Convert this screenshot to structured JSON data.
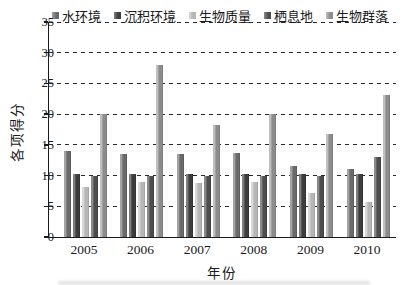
{
  "figure": {
    "background_color": "#ffffff",
    "axis_color": "#1a1a1a"
  },
  "chart_data": {
    "type": "bar",
    "title": "",
    "xlabel": "年份",
    "ylabel": "各项得分",
    "categories": [
      "2005",
      "2006",
      "2007",
      "2008",
      "2009",
      "2010"
    ],
    "series": [
      {
        "name": "水环境",
        "color": "#6a6a6a",
        "color_light": "#a2a2a2",
        "color_dark": "#565656",
        "values": [
          14.0,
          13.5,
          13.5,
          13.7,
          11.5,
          11.0
        ]
      },
      {
        "name": "沉积环境",
        "color": "#3d3d3d",
        "color_light": "#7e7e7e",
        "color_dark": "#2e2e2e",
        "values": [
          10.2,
          10.2,
          10.2,
          10.2,
          10.2,
          10.2
        ]
      },
      {
        "name": "生物质量",
        "color": "#b6b6b6",
        "color_light": "#d8d8d8",
        "color_dark": "#9c9c9c",
        "values": [
          8.1,
          8.9,
          8.8,
          8.9,
          7.2,
          5.7
        ]
      },
      {
        "name": "栖息地",
        "color": "#4d4d4d",
        "color_light": "#8a8a8a",
        "color_dark": "#3c3c3c",
        "values": [
          10.0,
          10.0,
          10.0,
          10.0,
          10.0,
          13.0
        ]
      },
      {
        "name": "生物群落",
        "color": "#8c8c8c",
        "color_light": "#bfbfbf",
        "color_dark": "#757575",
        "values": [
          20.0,
          28.0,
          18.2,
          20.0,
          16.7,
          23.2
        ]
      }
    ],
    "ylim": [
      0,
      35
    ],
    "yticks": [
      0,
      5,
      10,
      15,
      20,
      25,
      30,
      35
    ],
    "grid": "horizontal-dashed",
    "legend_position": "top-inside-horizontal"
  }
}
